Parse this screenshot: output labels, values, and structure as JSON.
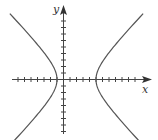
{
  "diagram": {
    "type": "hyperbola-graph",
    "labels": {
      "x_axis": "x",
      "y_axis": "y"
    },
    "origin_px": {
      "x": 63,
      "y": 79
    },
    "tick_spacing_px": 6.5,
    "x_ticks": {
      "negative": 7,
      "positive": 11
    },
    "y_ticks": {
      "positive": 9,
      "negative": 8
    },
    "curve": {
      "equation": "(x-2)^2/9 - y^2/k = 1",
      "center": [
        2,
        0
      ],
      "vertices": [
        [
          -1,
          0
        ],
        [
          5,
          0
        ]
      ],
      "opens": "horizontal",
      "color": "#555555"
    },
    "colors": {
      "axis": "#444444",
      "curve": "#555555",
      "background": "#ffffff"
    }
  }
}
